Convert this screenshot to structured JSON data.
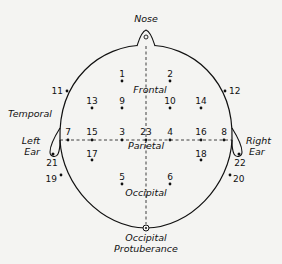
{
  "diagram": {
    "type": "EEG electrode placement map (top view of head)",
    "colors": {
      "background": "#f4f4f2",
      "ink": "#111111"
    },
    "landmarks": {
      "nose": "Nose",
      "left_ear": [
        "Left",
        "Ear"
      ],
      "right_ear": [
        "Right",
        "Ear"
      ],
      "occipital_protuberance": [
        "Occipital",
        "Protuberance"
      ]
    },
    "regions": {
      "frontal": "Frontal",
      "temporal": "Temporal",
      "parietal": "Parietal",
      "occipital": "Occipital"
    },
    "electrodes": [
      {
        "id": "1",
        "x": 122,
        "y": 81
      },
      {
        "id": "2",
        "x": 170,
        "y": 81
      },
      {
        "id": "9",
        "x": 122,
        "y": 108
      },
      {
        "id": "10",
        "x": 170,
        "y": 108
      },
      {
        "id": "13",
        "x": 92,
        "y": 108
      },
      {
        "id": "14",
        "x": 201,
        "y": 108
      },
      {
        "id": "7",
        "x": 68,
        "y": 140
      },
      {
        "id": "15",
        "x": 92,
        "y": 140
      },
      {
        "id": "3",
        "x": 122,
        "y": 140
      },
      {
        "id": "23",
        "x": 146,
        "y": 140
      },
      {
        "id": "4",
        "x": 170,
        "y": 140
      },
      {
        "id": "16",
        "x": 201,
        "y": 140
      },
      {
        "id": "8",
        "x": 224,
        "y": 140
      },
      {
        "id": "17",
        "x": 92,
        "y": 160
      },
      {
        "id": "18",
        "x": 201,
        "y": 160
      },
      {
        "id": "5",
        "x": 122,
        "y": 184
      },
      {
        "id": "6",
        "x": 170,
        "y": 184
      },
      {
        "id": "11",
        "x": 67,
        "y": 91
      },
      {
        "id": "12",
        "x": 225,
        "y": 91
      },
      {
        "id": "19",
        "x": 61,
        "y": 175
      },
      {
        "id": "20",
        "x": 230,
        "y": 175
      },
      {
        "id": "21",
        "x": 52,
        "y": 154
      },
      {
        "id": "22",
        "x": 238,
        "y": 154
      }
    ]
  }
}
